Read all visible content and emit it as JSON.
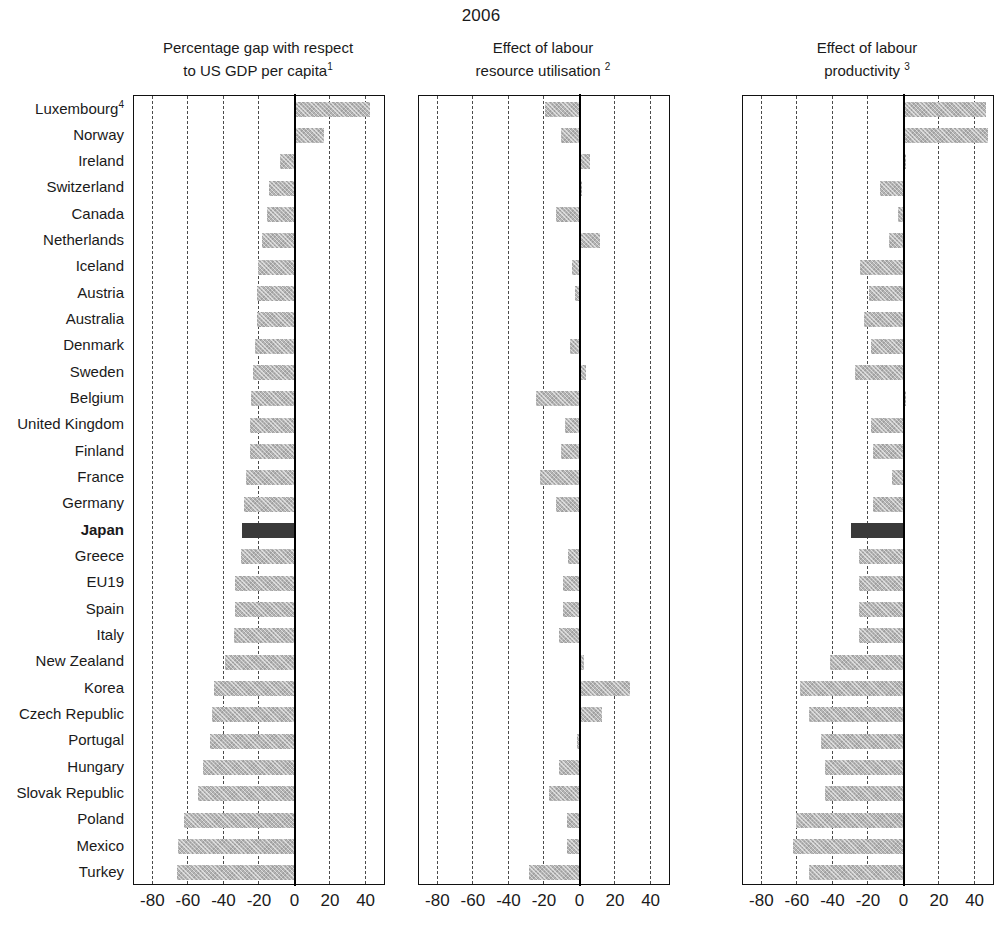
{
  "title": "2006",
  "panels": [
    {
      "key": "gap",
      "line1": "Percentage gap with respect",
      "line2": "to US GDP per capita",
      "note": "1"
    },
    {
      "key": "lru",
      "line1": "Effect of labour",
      "line2": "resource utilisation",
      "note": "2"
    },
    {
      "key": "prod",
      "line1": "Effect of labour",
      "line2": "productivity",
      "note": "3"
    }
  ],
  "axis": {
    "ticks": [
      "-80",
      "-60",
      "-40",
      "-20",
      "0",
      "20",
      "40"
    ],
    "tick_values": [
      -80,
      -60,
      -40,
      -20,
      0,
      20,
      40
    ],
    "min": -90,
    "max": 50
  },
  "highlight_country": "Japan",
  "colors": {
    "bar": "#b4b4b4",
    "bar_highlight": "#3a3a3a",
    "axis": "#111111",
    "grid": "#4a4a4a",
    "text": "#1a1a1a"
  },
  "chart_data": {
    "type": "bar",
    "orientation": "horizontal",
    "title": "2006",
    "xlabel": "",
    "ylabel": "",
    "xlim": [
      -90,
      50
    ],
    "grid": true,
    "legend": "none",
    "categories": [
      "Luxembourg",
      "Norway",
      "Ireland",
      "Switzerland",
      "Canada",
      "Netherlands",
      "Iceland",
      "Austria",
      "Australia",
      "Denmark",
      "Sweden",
      "Belgium",
      "United Kingdom",
      "Finland",
      "France",
      "Germany",
      "Japan",
      "Greece",
      "EU19",
      "Spain",
      "Italy",
      "New Zealand",
      "Korea",
      "Czech Republic",
      "Portugal",
      "Hungary",
      "Slovak Republic",
      "Poland",
      "Mexico",
      "Turkey"
    ],
    "category_labels": [
      "Luxembourg⁴",
      "Norway",
      "Ireland",
      "Switzerland",
      "Canada",
      "Netherlands",
      "Iceland",
      "Austria",
      "Australia",
      "Denmark",
      "Sweden",
      "Belgium",
      "United Kingdom",
      "Finland",
      "France",
      "Germany",
      "Japan",
      "Greece",
      "EU19",
      "Spain",
      "Italy",
      "New Zealand",
      "Korea",
      "Czech Republic",
      "Portugal",
      "Hungary",
      "Slovak Republic",
      "Poland",
      "Mexico",
      "Turkey"
    ],
    "series": [
      {
        "name": "Percentage gap with respect to US GDP per capita",
        "values": [
          43,
          17,
          -8,
          -14,
          -15,
          -18,
          -20,
          -21,
          -21,
          -22,
          -23,
          -24,
          -25,
          -25,
          -27,
          -28,
          -29,
          -30,
          -33,
          -33,
          -34,
          -39,
          -45,
          -46,
          -47,
          -51,
          -54,
          -62,
          -65,
          -66
        ]
      },
      {
        "name": "Effect of labour resource utilisation",
        "values": [
          -19,
          -10,
          6,
          2,
          -13,
          12,
          -4,
          -2,
          1,
          -5,
          4,
          -24,
          -8,
          -10,
          -22,
          -13,
          1,
          -6,
          -9,
          -9,
          -11,
          3,
          29,
          13,
          -1,
          -11,
          -17,
          -7,
          -7,
          -28
        ]
      },
      {
        "name": "Effect of labour productivity",
        "values": [
          47,
          48,
          2,
          -13,
          -3,
          -8,
          -24,
          -19,
          -22,
          -18,
          -27,
          2,
          -18,
          -17,
          -6,
          -17,
          -29,
          -25,
          -25,
          -25,
          -25,
          -41,
          -58,
          -53,
          -46,
          -44,
          -44,
          -60,
          -62,
          -53
        ]
      }
    ],
    "footnote_markers": {
      "panel1": "1",
      "panel2": "2",
      "panel3": "3",
      "luxembourg": "4"
    }
  }
}
